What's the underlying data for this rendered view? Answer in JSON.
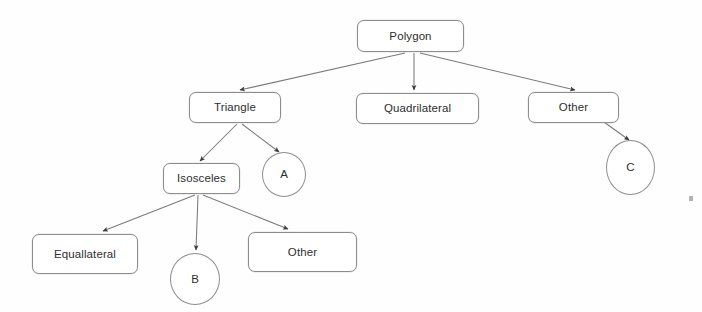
{
  "diagram": {
    "type": "tree-diagram",
    "stroke_color": "#8d8d8d",
    "text_color": "#2e2e2e",
    "background_color": "#ffffff",
    "nodes": [
      {
        "id": "polygon",
        "label": "Polygon",
        "shape": "rounded-rect",
        "x": 357,
        "y": 20,
        "w": 107,
        "h": 32
      },
      {
        "id": "triangle",
        "label": "Triangle",
        "shape": "rounded-rect",
        "x": 189,
        "y": 92,
        "w": 92,
        "h": 31
      },
      {
        "id": "quadrilateral",
        "label": "Quadrilateral",
        "shape": "rounded-rect",
        "x": 356,
        "y": 93,
        "w": 123,
        "h": 31
      },
      {
        "id": "other-top",
        "label": "Other",
        "shape": "rounded-rect",
        "x": 528,
        "y": 92,
        "w": 91,
        "h": 31
      },
      {
        "id": "isosceles",
        "label": "Isosceles",
        "shape": "rounded-rect",
        "x": 163,
        "y": 163,
        "w": 77,
        "h": 31
      },
      {
        "id": "equallateral",
        "label": "Equallateral",
        "shape": "rounded-rect",
        "x": 32,
        "y": 234,
        "w": 106,
        "h": 40
      },
      {
        "id": "other-bottom",
        "label": "Other",
        "shape": "rounded-rect",
        "x": 248,
        "y": 232,
        "w": 109,
        "h": 40
      },
      {
        "id": "circle-a",
        "label": "A",
        "shape": "circle",
        "x": 262,
        "y": 152,
        "w": 44,
        "h": 45
      },
      {
        "id": "circle-b",
        "label": "B",
        "shape": "circle",
        "x": 170,
        "y": 253,
        "w": 50,
        "h": 52
      },
      {
        "id": "circle-c",
        "label": "C",
        "shape": "circle",
        "x": 606,
        "y": 140,
        "w": 49,
        "h": 55
      }
    ],
    "edges": [
      {
        "id": "polygon-to-triangle",
        "from": "polygon",
        "to": "triangle",
        "x1": 405,
        "y1": 53,
        "x2": 240,
        "y2": 90,
        "arrow": true
      },
      {
        "id": "polygon-to-quadrilateral",
        "from": "polygon",
        "to": "quadrilateral",
        "x1": 414,
        "y1": 53,
        "x2": 414,
        "y2": 90,
        "arrow": true
      },
      {
        "id": "polygon-to-other",
        "from": "polygon",
        "to": "other-top",
        "x1": 420,
        "y1": 53,
        "x2": 575,
        "y2": 90,
        "arrow": true
      },
      {
        "id": "triangle-to-isosceles",
        "from": "triangle",
        "to": "isosceles",
        "x1": 237,
        "y1": 124,
        "x2": 200,
        "y2": 161,
        "arrow": true
      },
      {
        "id": "triangle-to-a",
        "from": "triangle",
        "to": "circle-a",
        "x1": 242,
        "y1": 124,
        "x2": 279,
        "y2": 152,
        "arrow": true
      },
      {
        "id": "other-to-c",
        "from": "other-top",
        "to": "circle-c",
        "x1": 597,
        "y1": 117,
        "x2": 629,
        "y2": 140,
        "arrow": true
      },
      {
        "id": "isosceles-to-equallateral",
        "from": "isosceles",
        "to": "equallateral",
        "x1": 195,
        "y1": 195,
        "x2": 103,
        "y2": 231,
        "arrow": true
      },
      {
        "id": "isosceles-to-b",
        "from": "isosceles",
        "to": "circle-b",
        "x1": 198,
        "y1": 195,
        "x2": 196,
        "y2": 250,
        "arrow": true
      },
      {
        "id": "isosceles-to-other",
        "from": "isosceles",
        "to": "other-bottom",
        "x1": 203,
        "y1": 195,
        "x2": 288,
        "y2": 229,
        "arrow": true
      }
    ],
    "artifacts": [
      {
        "id": "scan-speck",
        "x": 689,
        "y": 196,
        "w": 4,
        "h": 5
      }
    ]
  }
}
